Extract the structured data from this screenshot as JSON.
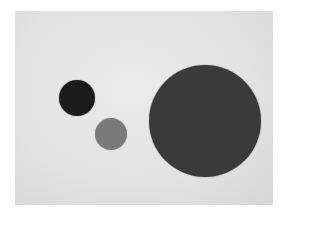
{
  "scene": {
    "description": "Grayscale photo of three circular discs on a light paper background",
    "background_color": "#e4e4e4",
    "circles": [
      {
        "name": "small-dark-disc",
        "cx": 77,
        "cy": 98,
        "r": 18,
        "color": "#1c1c1c"
      },
      {
        "name": "medium-gray-disc",
        "cx": 111,
        "cy": 134,
        "r": 16,
        "color": "#7a7a7a"
      },
      {
        "name": "large-dark-disc",
        "cx": 205,
        "cy": 121,
        "r": 56,
        "color": "#3a3a3a"
      }
    ]
  }
}
